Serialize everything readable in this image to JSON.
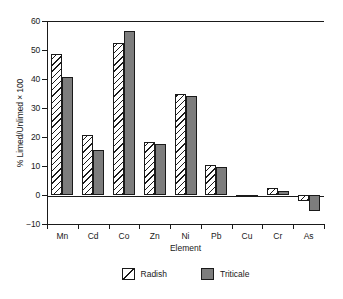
{
  "chart_data": {
    "type": "bar",
    "title": "",
    "xlabel": "Element",
    "ylabel": "% Limed/Unlimed × 100",
    "categories": [
      "Mn",
      "Cd",
      "Co",
      "Zn",
      "Ni",
      "Pb",
      "Cu",
      "Cr",
      "As"
    ],
    "series": [
      {
        "name": "Radish",
        "style": "white-diagonal-hatch",
        "color": "#ffffff",
        "values": [
          48.7,
          20.6,
          52.4,
          18.4,
          34.8,
          10.5,
          -0.6,
          2.5,
          -2.0
        ]
      },
      {
        "name": "Triticale",
        "style": "solid-gray",
        "color": "#7d7d7d",
        "values": [
          40.8,
          15.5,
          56.5,
          17.6,
          34.0,
          9.5,
          -0.5,
          1.4,
          -5.6
        ]
      }
    ],
    "ylim": [
      -10,
      60
    ],
    "yticks": [
      60,
      50,
      40,
      30,
      20,
      10,
      0,
      -10
    ],
    "ytick_labels": [
      "60",
      "50",
      "40",
      "30",
      "20",
      "10",
      "0",
      "−10"
    ],
    "grid": false,
    "legend_position": "bottom-center",
    "axis_color": "#1a1a1a",
    "background": "#ffffff"
  },
  "legend": {
    "entries": [
      {
        "label": "Radish",
        "swatch": "hatched-swatch"
      },
      {
        "label": "Triticale",
        "swatch": "gray-swatch"
      }
    ]
  }
}
